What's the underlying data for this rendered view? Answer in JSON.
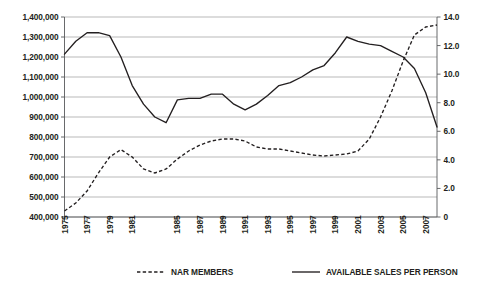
{
  "chart_data": {
    "type": "line",
    "title": "",
    "xlabel": "",
    "ylabel": "",
    "grid": true,
    "legend_position": "bottom",
    "x": [
      1975,
      1976,
      1977,
      1978,
      1979,
      1980,
      1981,
      1982,
      1983,
      1984,
      1985,
      1986,
      1987,
      1988,
      1989,
      1990,
      1991,
      1992,
      1993,
      1994,
      1995,
      1996,
      1997,
      1998,
      1999,
      2000,
      2001,
      2002,
      2003,
      2004,
      2005,
      2006,
      2007,
      2008
    ],
    "x_tick_labels": [
      "1975",
      "1977",
      "1979",
      "1981",
      "1985",
      "1987",
      "1989",
      "1991",
      "1993",
      "1995",
      "1997",
      "1999",
      "2001",
      "2003",
      "2005",
      "2007"
    ],
    "x_tick_values": [
      1975,
      1977,
      1979,
      1981,
      1985,
      1987,
      1989,
      1991,
      1993,
      1995,
      1997,
      1999,
      2001,
      2003,
      2005,
      2007
    ],
    "axes": {
      "left": {
        "label": "",
        "min": 400000,
        "max": 1400000,
        "step": 100000,
        "ticks": [
          "400,000",
          "500,000",
          "600,000",
          "700,000",
          "800,000",
          "900,000",
          "1,000,000",
          "1,100,000",
          "1,200,000",
          "1,300,000",
          "1,400,000"
        ],
        "tick_values": [
          400000,
          500000,
          600000,
          700000,
          800000,
          900000,
          1000000,
          1100000,
          1200000,
          1300000,
          1400000
        ]
      },
      "right": {
        "label": "",
        "min": 0,
        "max": 14.0,
        "step": 2.0,
        "ticks": [
          "0",
          "2.0",
          "4.0",
          "6.0",
          "8.0",
          "10.0",
          "12.0",
          "14.0"
        ],
        "tick_values": [
          0,
          2.0,
          4.0,
          6.0,
          8.0,
          10.0,
          12.0,
          14.0
        ]
      }
    },
    "series": [
      {
        "name": "NAR MEMBERS",
        "style": "dashed",
        "axis": "left",
        "color": "#231f20",
        "values": [
          430000,
          470000,
          530000,
          620000,
          700000,
          737000,
          700000,
          640000,
          620000,
          640000,
          690000,
          730000,
          760000,
          780000,
          790000,
          790000,
          780000,
          750000,
          740000,
          740000,
          730000,
          720000,
          710000,
          705000,
          710000,
          715000,
          730000,
          790000,
          900000,
          1030000,
          1180000,
          1310000,
          1350000,
          1360000
        ]
      },
      {
        "name": "AVAILABLE SALES PER PERSON",
        "style": "solid",
        "axis": "right",
        "color": "#231f20",
        "values": [
          11.4,
          12.3,
          12.9,
          12.9,
          12.7,
          11.2,
          9.2,
          7.9,
          7.0,
          6.6,
          8.2,
          8.3,
          8.3,
          8.6,
          8.6,
          7.9,
          7.5,
          7.9,
          8.5,
          9.2,
          9.4,
          9.8,
          10.3,
          10.6,
          11.5,
          12.6,
          12.3,
          12.1,
          12.0,
          11.6,
          11.2,
          10.4,
          8.7,
          6.3
        ]
      }
    ],
    "legend": [
      {
        "label": "NAR MEMBERS",
        "style": "dashed"
      },
      {
        "label": "AVAILABLE SALES PER PERSON",
        "style": "solid"
      }
    ]
  }
}
